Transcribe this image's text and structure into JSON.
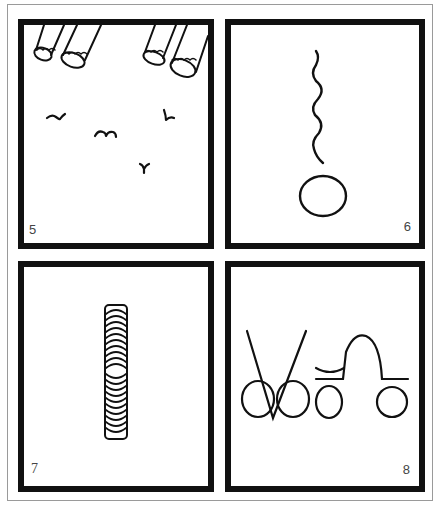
{
  "page": {
    "background": "#ffffff",
    "frame_color": "#9a9a9a",
    "panel_border_color": "#111111",
    "ink_color": "#111111"
  },
  "panels": [
    {
      "number": "5",
      "description": "Four cylinders (cannons/telescopes) pointing down from top edge with birds flying below",
      "number_position": "bottom-left",
      "elements": [
        "cylinder",
        "cylinder",
        "cylinder",
        "cylinder",
        "bird",
        "bird",
        "bird",
        "bird"
      ]
    },
    {
      "number": "6",
      "description": "Wavy vertical line ending in a circle at bottom",
      "number_position": "bottom-right",
      "elements": [
        "wavy-line",
        "circle"
      ]
    },
    {
      "number": "7",
      "description": "Tall narrow rounded rectangle filled with stacked arcs (coil)",
      "number_position": "bottom-left",
      "elements": [
        "coil"
      ]
    },
    {
      "number": "8",
      "description": "V-shaped lines over two circles, circle with bar and curve, arch over baseline and circle",
      "number_position": "bottom-right",
      "elements": [
        "v-lines",
        "circle",
        "circle",
        "circle-with-bar",
        "arch",
        "circle"
      ]
    }
  ]
}
